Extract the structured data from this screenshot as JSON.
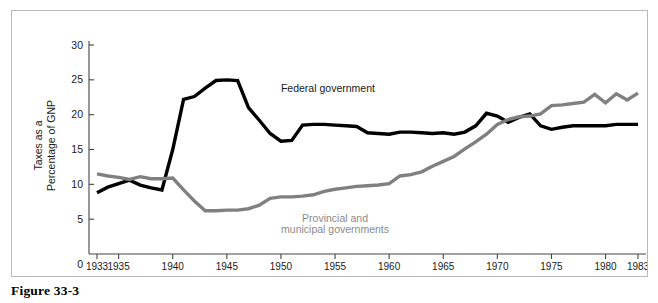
{
  "figure": {
    "caption": "Figure 33-3"
  },
  "chart_data": {
    "type": "line",
    "title": "",
    "xlabel": "",
    "ylabel": "Taxes as a Percentage of GNP",
    "ylabel_line1": "Taxes as a",
    "ylabel_line2": "Percentage of GNP",
    "xlim": [
      1933,
      1983
    ],
    "ylim": [
      0,
      30
    ],
    "grid": false,
    "legend_position": "inline-annotation",
    "y_ticks": [
      0,
      5,
      10,
      15,
      20,
      25,
      30
    ],
    "y_tick_labels": [
      "0",
      "5",
      "10",
      "15",
      "20",
      "25",
      "30"
    ],
    "zero_label": "0",
    "x_ticks": [
      1933,
      1935,
      1940,
      1945,
      1950,
      1955,
      1960,
      1965,
      1970,
      1975,
      1980,
      1983
    ],
    "x_tick_labels": [
      "1933",
      "1935",
      "1940",
      "1945",
      "1950",
      "1955",
      "1960",
      "1965",
      "1970",
      "1975",
      "1980",
      "1983"
    ],
    "x": [
      1933,
      1934,
      1935,
      1936,
      1937,
      1938,
      1939,
      1940,
      1941,
      1942,
      1943,
      1944,
      1945,
      1946,
      1947,
      1948,
      1949,
      1950,
      1951,
      1952,
      1953,
      1954,
      1955,
      1956,
      1957,
      1958,
      1959,
      1960,
      1961,
      1962,
      1963,
      1964,
      1965,
      1966,
      1967,
      1968,
      1969,
      1970,
      1971,
      1972,
      1973,
      1974,
      1975,
      1976,
      1977,
      1978,
      1979,
      1980,
      1981,
      1982,
      1983
    ],
    "series": [
      {
        "name": "Federal government",
        "color": "#000000",
        "label_x": 1950,
        "label_y": 23.2,
        "values": [
          8.8,
          9.6,
          10.1,
          10.6,
          9.9,
          9.5,
          9.2,
          15.0,
          22.2,
          22.6,
          23.8,
          24.9,
          25.0,
          24.9,
          21.0,
          19.2,
          17.3,
          16.2,
          16.3,
          18.5,
          18.6,
          18.6,
          18.5,
          18.4,
          18.3,
          17.4,
          17.3,
          17.2,
          17.5,
          17.5,
          17.4,
          17.3,
          17.4,
          17.2,
          17.5,
          18.4,
          20.2,
          19.8,
          18.9,
          19.6,
          20.1,
          18.4,
          17.9,
          18.2,
          18.4,
          18.4,
          18.4,
          18.4,
          18.6,
          18.6,
          18.6
        ]
      },
      {
        "name": "Provincial and municipal governments",
        "color": "#808080",
        "label_x": 1955,
        "label_y": 4.6,
        "label_line1": "Provincial and",
        "label_line2": "municipal governments",
        "values": [
          11.5,
          11.2,
          11.0,
          10.7,
          11.1,
          10.8,
          10.8,
          10.9,
          9.2,
          7.6,
          6.2,
          6.2,
          6.3,
          6.3,
          6.5,
          7.0,
          8.0,
          8.2,
          8.2,
          8.3,
          8.5,
          9.0,
          9.3,
          9.5,
          9.7,
          9.8,
          9.9,
          10.1,
          11.2,
          11.4,
          11.8,
          12.6,
          13.3,
          14.0,
          15.1,
          16.1,
          17.2,
          18.6,
          19.3,
          19.7,
          19.8,
          20.1,
          21.3,
          21.4,
          21.6,
          21.8,
          22.9,
          21.7,
          23.0,
          22.1,
          23.1
        ]
      }
    ]
  }
}
